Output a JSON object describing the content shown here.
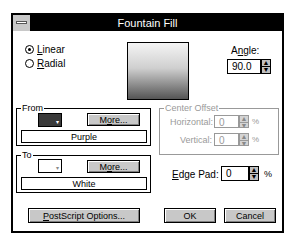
{
  "window": {
    "title": "Fountain Fill"
  },
  "type": {
    "options": [
      {
        "label": "Linear",
        "accel": "L",
        "rest": "inear",
        "selected": true
      },
      {
        "label": "Radial",
        "accel": "R",
        "rest": "adial",
        "selected": false
      }
    ]
  },
  "angle": {
    "label_pre": "A",
    "label_accel": "n",
    "label_post": "gle:",
    "value": "90.0"
  },
  "from": {
    "group_label": "From",
    "color_name": "Purple",
    "swatch_color": "#3a3a3a",
    "more_pre": "M",
    "more_accel": "o",
    "more_post": "re..."
  },
  "to": {
    "group_label": "To",
    "color_name": "White",
    "swatch_color": "#ffffff",
    "more_pre": "M",
    "more_accel": "o",
    "more_post": "re..."
  },
  "center_offset": {
    "group_label": "Center Offset",
    "horizontal": {
      "label": "Horizontal:",
      "value": "0",
      "unit": "%"
    },
    "vertical": {
      "label": "Vertical:",
      "value": "0",
      "unit": "%"
    }
  },
  "edge_pad": {
    "label_accel": "E",
    "label_post": "dge Pad:",
    "value": "0",
    "unit": "%"
  },
  "buttons": {
    "postscript_accel": "P",
    "postscript_post": "ostScript Options...",
    "ok": "OK",
    "cancel": "Cancel"
  },
  "icons": {
    "spin_up": "▲",
    "spin_down": "▼",
    "dropdown": "▾"
  }
}
